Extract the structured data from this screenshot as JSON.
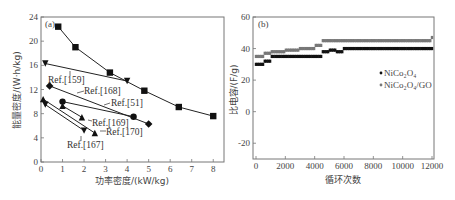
{
  "chart_data": [
    {
      "type": "line",
      "panel_label": "(a)",
      "title": "",
      "xlabel": "功率密度/(kW/kg)",
      "ylabel": "能量密度/(W·h/kg)",
      "xlim": [
        0,
        8.5
      ],
      "ylim": [
        0,
        24
      ],
      "xticks": [
        0,
        1,
        2,
        3,
        4,
        5,
        6,
        7,
        8
      ],
      "yticks": [
        0,
        4,
        8,
        12,
        16,
        20,
        24
      ],
      "grid": false,
      "series": [
        {
          "name": "This work",
          "marker": "square",
          "x": [
            0.8,
            1.6,
            3.2,
            4.8,
            6.4,
            8.0
          ],
          "y": [
            22.4,
            19.0,
            14.8,
            11.8,
            9.1,
            7.6
          ]
        },
        {
          "name": "Ref.[159]",
          "marker": "triangle-down",
          "x": [
            0.2,
            4.0
          ],
          "y": [
            16.3,
            13.4
          ]
        },
        {
          "name": "Ref.[168]",
          "marker": "diamond",
          "x": [
            0.4,
            5.0
          ],
          "y": [
            12.6,
            6.3
          ]
        },
        {
          "name": "Ref.[51]",
          "marker": "circle",
          "x": [
            1.0,
            4.3
          ],
          "y": [
            10.0,
            7.5
          ]
        },
        {
          "name": "Ref.[169]",
          "marker": "triangle-up",
          "x": [
            1.0,
            1.9
          ],
          "y": [
            9.3,
            7.4
          ]
        },
        {
          "name": "Ref.[170]",
          "marker": "triangle-up",
          "x": [
            0.1,
            2.5
          ],
          "y": [
            10.4,
            4.8
          ]
        },
        {
          "name": "Ref.[167]",
          "marker": "triangle-down",
          "x": [
            0.2,
            2.0
          ],
          "y": [
            9.5,
            5.2
          ]
        }
      ],
      "annotations": [
        "Ref.[159]",
        "Ref.[168]",
        "Ref.[51]",
        "Ref.[169]",
        "Ref.[170]",
        "Ref.[167]"
      ]
    },
    {
      "type": "scatter",
      "panel_label": "(b)",
      "title": "",
      "xlabel": "循环次数",
      "ylabel": "比电容/(F/g)",
      "xlim": [
        0,
        12000
      ],
      "ylim": [
        -30,
        60
      ],
      "xticks": [
        0,
        2000,
        4000,
        6000,
        8000,
        10000,
        12000
      ],
      "yticks": [
        -20,
        0,
        20,
        40,
        60
      ],
      "grid": false,
      "legend_position": "right-middle",
      "series": [
        {
          "name": "NiCo2O4",
          "color": "#111111",
          "x": [
            0,
            500,
            1000,
            2000,
            3000,
            4000,
            4500,
            5000,
            5500,
            6000,
            7000,
            8000,
            9000,
            10000,
            11000,
            12000
          ],
          "y": [
            30,
            32,
            35,
            35,
            35,
            35,
            38,
            39,
            38,
            40,
            40,
            40,
            40,
            40,
            40,
            40
          ]
        },
        {
          "name": "NiCo2O4/GO",
          "color": "#777777",
          "x": [
            0,
            500,
            1000,
            2000,
            3000,
            4000,
            4500,
            5000,
            6000,
            7000,
            8000,
            9000,
            10000,
            11000,
            12000
          ],
          "y": [
            35,
            37,
            38,
            39,
            40,
            42,
            45,
            45,
            45,
            45,
            45,
            45,
            45,
            45,
            47
          ]
        }
      ]
    }
  ],
  "legend_b": {
    "item1": "NiCo₂O₄",
    "item2": "NiCo₂O₄/GO"
  },
  "labels": {
    "a_panel": "(a)",
    "b_panel": "(b)",
    "a_xlabel": "功率密度/(kW/kg)",
    "a_ylabel": "能量密度/(W·h/kg)",
    "b_xlabel": "循环次数",
    "b_ylabel": "比电容/(F/g)"
  }
}
